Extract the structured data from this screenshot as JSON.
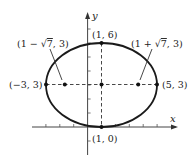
{
  "diagram": {
    "type": "ellipse-graph",
    "axes": {
      "x_label": "x",
      "y_label": "y"
    },
    "ellipse": {
      "center": [
        1,
        3
      ],
      "semi_major_horizontal": 4,
      "semi_minor_vertical": 3
    },
    "points": [
      {
        "id": "top-vertex",
        "coords": [
          1,
          6
        ],
        "label": "(1, 6)"
      },
      {
        "id": "bottom-vertex",
        "coords": [
          1,
          0
        ],
        "label": "(1, 0)"
      },
      {
        "id": "left-vertex",
        "coords": [
          -3,
          3
        ],
        "label": "(−3, 3)"
      },
      {
        "id": "right-vertex",
        "coords": [
          5,
          3
        ],
        "label": "(5, 3)"
      },
      {
        "id": "left-focus",
        "coords": [
          -1.6458,
          3
        ],
        "label_prefix": "(1 − ",
        "label_radical": "7",
        "label_suffix": ", 3)"
      },
      {
        "id": "right-focus",
        "coords": [
          3.6458,
          3
        ],
        "label_prefix": "(1 + ",
        "label_radical": "7",
        "label_suffix": ", 3)"
      },
      {
        "id": "center",
        "coords": [
          1,
          3
        ],
        "label": ""
      }
    ],
    "colors": {
      "stroke": "#222222",
      "background": "#ffffff"
    }
  }
}
